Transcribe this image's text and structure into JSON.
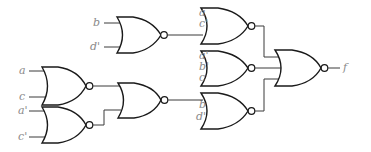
{
  "diagram": {
    "type": "logic-circuit",
    "gates": [
      {
        "id": "g_bd",
        "type": "NOR",
        "inputs": [
          "b",
          "d'"
        ]
      },
      {
        "id": "g_ac",
        "type": "NOR",
        "inputs": [
          "a",
          "c"
        ]
      },
      {
        "id": "g_acp",
        "type": "NOR",
        "inputs": [
          "a'",
          "c'"
        ]
      },
      {
        "id": "g_mid",
        "type": "NOR",
        "inputs": [
          "g_ac",
          "g_acp"
        ]
      },
      {
        "id": "g_top",
        "type": "NOR",
        "inputs": [
          "a",
          "c'",
          "g_bd"
        ]
      },
      {
        "id": "g_center",
        "type": "NOR",
        "inputs": [
          "a'",
          "b'",
          "c"
        ]
      },
      {
        "id": "g_bottom",
        "type": "NOR",
        "inputs": [
          "g_mid",
          "b",
          "d'"
        ]
      },
      {
        "id": "g_out",
        "type": "NOR",
        "inputs": [
          "g_top",
          "g_center",
          "g_bottom"
        ],
        "output": "f"
      }
    ],
    "labels": {
      "g_bd_in1": "b",
      "g_bd_in2": "d'",
      "g_ac_in1": "a",
      "g_ac_in2": "c",
      "g_acp_in1": "a'",
      "g_acp_in2": "c'",
      "g_top_in1": "a",
      "g_top_in2": "c'",
      "g_center_in1": "a'",
      "g_center_in2": "b'",
      "g_center_in3": "c",
      "g_bottom_in2": "b",
      "g_bottom_in3": "d'",
      "output": "f"
    }
  }
}
